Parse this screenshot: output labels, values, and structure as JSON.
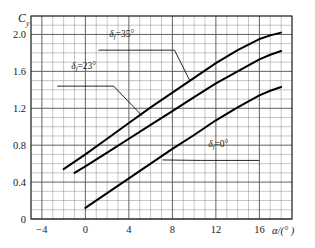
{
  "chart_data": {
    "type": "line",
    "title": "",
    "xlabel": "α/(° )",
    "ylabel": "C",
    "ylabel_sub": "y",
    "xlim": [
      -5,
      19
    ],
    "ylim": [
      0,
      2.2
    ],
    "grid": true,
    "grid_major_x_step": 4,
    "grid_minor_x_step": 1,
    "grid_major_y_step": 0.4,
    "grid_minor_y_step": 0.1,
    "xticks": [
      -4,
      0,
      4,
      8,
      12,
      16
    ],
    "xtick_labels": [
      "−4",
      "0",
      "4",
      "8",
      "12",
      "16"
    ],
    "yticks": [
      0,
      0.4,
      0.8,
      1.2,
      1.6,
      2.0
    ],
    "ytick_labels": [
      "0",
      "0.4",
      "0.8",
      "1.2",
      "1.6",
      "2.0"
    ],
    "legend_position": "inline-annotations",
    "series": [
      {
        "name": "δf=35°",
        "label": "δ=35°",
        "label_sub": "f",
        "x": [
          -2,
          0,
          2,
          4,
          6,
          8,
          10,
          12,
          14,
          16,
          17,
          18
        ],
        "y": [
          0.54,
          0.7,
          0.87,
          1.04,
          1.21,
          1.37,
          1.53,
          1.69,
          1.83,
          1.95,
          1.99,
          2.02
        ],
        "annotation_text_xy": [
          2.2,
          1.97
        ],
        "annotation_underline_from_x": 1.2,
        "annotation_underline_to_x": 8.2,
        "annotation_underline_y": 1.83,
        "leader_to_xy": [
          9.6,
          1.5
        ]
      },
      {
        "name": "δf=23°",
        "label": "δ=23°",
        "label_sub": "f",
        "x": [
          -1,
          0,
          2,
          4,
          6,
          8,
          10,
          12,
          14,
          16,
          17,
          18
        ],
        "y": [
          0.5,
          0.57,
          0.72,
          0.87,
          1.02,
          1.17,
          1.32,
          1.47,
          1.6,
          1.73,
          1.78,
          1.82
        ],
        "annotation_text_xy": [
          -1.3,
          1.63
        ],
        "annotation_underline_from_x": -2.6,
        "annotation_underline_to_x": 2.6,
        "annotation_underline_y": 1.44,
        "leader_to_xy": [
          5.2,
          1.12
        ]
      },
      {
        "name": "δf=0°",
        "label": "δ=0°",
        "label_sub": "f",
        "x": [
          0,
          2,
          4,
          6,
          8,
          10,
          12,
          14,
          16,
          17,
          18
        ],
        "y": [
          0.12,
          0.28,
          0.44,
          0.6,
          0.76,
          0.91,
          1.07,
          1.21,
          1.34,
          1.39,
          1.43
        ],
        "annotation_text_xy": [
          11.3,
          0.78
        ],
        "annotation_underline_from_x": 10.6,
        "annotation_underline_to_x": 16.0,
        "annotation_underline_y": 0.635,
        "leader_to_xy": [
          7.1,
          0.64
        ]
      }
    ],
    "colors": {
      "curve": "#000000",
      "grid_major": "#5a5a5a",
      "grid_minor": "#8c8c8c",
      "axis": "#1a1a1a",
      "text": "#1a1a1a",
      "background": "#ffffff"
    }
  }
}
